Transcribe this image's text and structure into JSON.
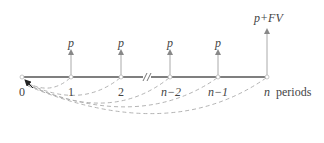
{
  "diagram": {
    "type": "cash-flow-timeline",
    "axis_label": "periods",
    "nodes": [
      {
        "label": "0",
        "x": 22,
        "italic": false
      },
      {
        "label": "1",
        "x": 71,
        "italic": false
      },
      {
        "label": "2",
        "x": 121,
        "italic": false
      },
      {
        "label": "n−2",
        "x": 170,
        "italic": true
      },
      {
        "label": "n−1",
        "x": 218,
        "italic": true
      },
      {
        "label": "n",
        "x": 267,
        "italic": true
      }
    ],
    "cash_flows": [
      {
        "at": "1",
        "label": "p",
        "x": 71
      },
      {
        "at": "2",
        "label": "p",
        "x": 121
      },
      {
        "at": "n−2",
        "label": "p",
        "x": 170
      },
      {
        "at": "n−1",
        "label": "p",
        "x": 218
      },
      {
        "at": "n",
        "label": "p+FV",
        "x": 267
      }
    ],
    "break_marker_x": 147,
    "discount_arcs_to": "0",
    "colors": {
      "timeline": "#555555",
      "arrow": "#999999",
      "arc": "#aaaaaa",
      "text": "#444444",
      "origin_arrow": "#222222"
    }
  }
}
